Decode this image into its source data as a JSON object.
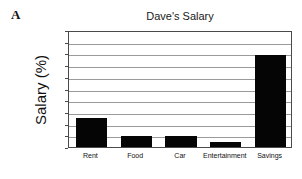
{
  "panel": {
    "label": "A"
  },
  "chart_data": {
    "type": "bar",
    "title": "Dave's Salary",
    "xlabel": "",
    "ylabel": "Salary (%)",
    "categories": [
      "Rent",
      "Food",
      "Car",
      "Entertainment",
      "Savings"
    ],
    "values": [
      25,
      9,
      9,
      4,
      79
    ],
    "ylim": [
      0,
      100
    ],
    "ytick_labels": [
      "0",
      "10",
      "20",
      "30",
      "40",
      "50",
      "60",
      "70",
      "80",
      "90",
      "100"
    ],
    "ytick_values": [
      0,
      10,
      20,
      30,
      40,
      50,
      60,
      70,
      80,
      90,
      100
    ],
    "grid": true,
    "legend": false,
    "bar_color": "#050505",
    "grid_color": "#9a9a9a",
    "axis_color": "#4a4a4a",
    "background": "#ffffff"
  }
}
